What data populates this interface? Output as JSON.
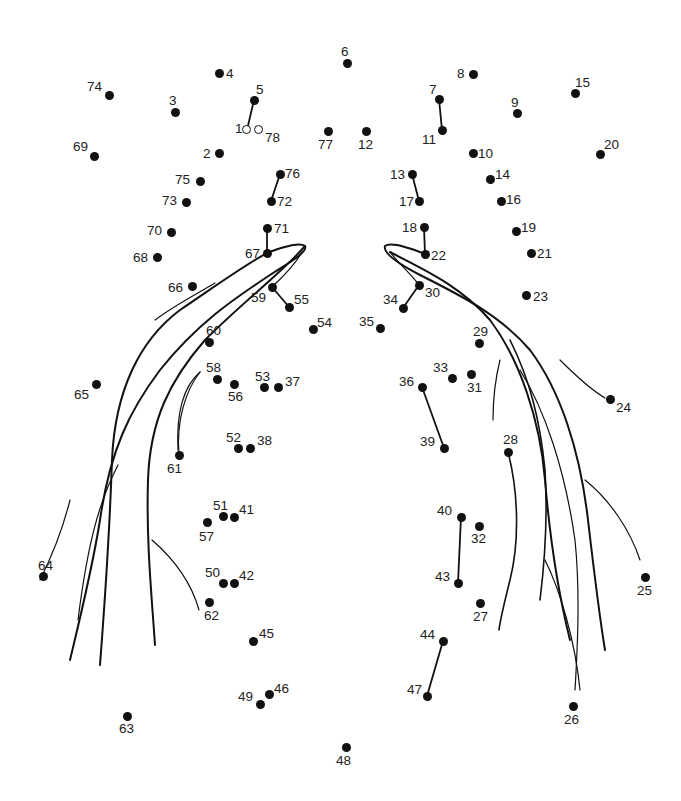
{
  "puzzle": {
    "type": "connect-the-dots",
    "ink_color": "#111111",
    "background": "#ffffff",
    "dots": [
      {
        "n": "1",
        "x": 247,
        "y": 130,
        "hollow": true,
        "lx": 235,
        "ly": 122
      },
      {
        "n": "2",
        "x": 219,
        "y": 153,
        "lx": 203,
        "ly": 147
      },
      {
        "n": "3",
        "x": 175,
        "y": 112,
        "lx": 169,
        "ly": 94
      },
      {
        "n": "4",
        "x": 219,
        "y": 73,
        "lx": 226,
        "ly": 67
      },
      {
        "n": "5",
        "x": 254,
        "y": 100,
        "lx": 256,
        "ly": 83
      },
      {
        "n": "6",
        "x": 347,
        "y": 63,
        "lx": 341,
        "ly": 45
      },
      {
        "n": "7",
        "x": 439,
        "y": 99,
        "lx": 429,
        "ly": 83
      },
      {
        "n": "8",
        "x": 473,
        "y": 74,
        "lx": 457,
        "ly": 67
      },
      {
        "n": "9",
        "x": 517,
        "y": 113,
        "lx": 511,
        "ly": 96
      },
      {
        "n": "10",
        "x": 473,
        "y": 153,
        "lx": 478,
        "ly": 147
      },
      {
        "n": "11",
        "x": 442,
        "y": 130,
        "lx": 422,
        "ly": 133
      },
      {
        "n": "12",
        "x": 366,
        "y": 131,
        "lx": 358,
        "ly": 138
      },
      {
        "n": "13",
        "x": 412,
        "y": 174,
        "lx": 390,
        "ly": 168
      },
      {
        "n": "14",
        "x": 490,
        "y": 179,
        "lx": 495,
        "ly": 168
      },
      {
        "n": "15",
        "x": 575,
        "y": 93,
        "lx": 575,
        "ly": 76
      },
      {
        "n": "16",
        "x": 501,
        "y": 201,
        "lx": 506,
        "ly": 193
      },
      {
        "n": "17",
        "x": 419,
        "y": 201,
        "lx": 399,
        "ly": 195
      },
      {
        "n": "18",
        "x": 424,
        "y": 227,
        "lx": 402,
        "ly": 221
      },
      {
        "n": "19",
        "x": 516,
        "y": 231,
        "lx": 521,
        "ly": 221
      },
      {
        "n": "20",
        "x": 600,
        "y": 154,
        "lx": 604,
        "ly": 138
      },
      {
        "n": "21",
        "x": 531,
        "y": 253,
        "lx": 537,
        "ly": 247
      },
      {
        "n": "22",
        "x": 425,
        "y": 254,
        "lx": 431,
        "ly": 249
      },
      {
        "n": "23",
        "x": 526,
        "y": 295,
        "lx": 533,
        "ly": 290
      },
      {
        "n": "24",
        "x": 610,
        "y": 399,
        "lx": 616,
        "ly": 401
      },
      {
        "n": "25",
        "x": 645,
        "y": 577,
        "lx": 637,
        "ly": 584
      },
      {
        "n": "26",
        "x": 573,
        "y": 706,
        "lx": 564,
        "ly": 713
      },
      {
        "n": "27",
        "x": 480,
        "y": 603,
        "lx": 473,
        "ly": 610
      },
      {
        "n": "28",
        "x": 508,
        "y": 452,
        "lx": 503,
        "ly": 433
      },
      {
        "n": "29",
        "x": 479,
        "y": 343,
        "lx": 473,
        "ly": 325
      },
      {
        "n": "30",
        "x": 419,
        "y": 285,
        "lx": 425,
        "ly": 286
      },
      {
        "n": "31",
        "x": 471,
        "y": 374,
        "lx": 467,
        "ly": 381
      },
      {
        "n": "32",
        "x": 479,
        "y": 526,
        "lx": 471,
        "ly": 532
      },
      {
        "n": "33",
        "x": 452,
        "y": 378,
        "lx": 433,
        "ly": 361
      },
      {
        "n": "34",
        "x": 403,
        "y": 308,
        "lx": 383,
        "ly": 293
      },
      {
        "n": "35",
        "x": 380,
        "y": 328,
        "lx": 359,
        "ly": 315
      },
      {
        "n": "36",
        "x": 422,
        "y": 387,
        "lx": 399,
        "ly": 375
      },
      {
        "n": "37",
        "x": 278,
        "y": 387,
        "lx": 285,
        "ly": 375
      },
      {
        "n": "38",
        "x": 250,
        "y": 448,
        "lx": 257,
        "ly": 434
      },
      {
        "n": "39",
        "x": 444,
        "y": 448,
        "lx": 420,
        "ly": 435
      },
      {
        "n": "40",
        "x": 461,
        "y": 517,
        "lx": 437,
        "ly": 504
      },
      {
        "n": "41",
        "x": 234,
        "y": 517,
        "lx": 239,
        "ly": 503
      },
      {
        "n": "42",
        "x": 234,
        "y": 583,
        "lx": 239,
        "ly": 569
      },
      {
        "n": "43",
        "x": 458,
        "y": 583,
        "lx": 435,
        "ly": 570
      },
      {
        "n": "44",
        "x": 443,
        "y": 641,
        "lx": 420,
        "ly": 628
      },
      {
        "n": "45",
        "x": 253,
        "y": 641,
        "lx": 259,
        "ly": 627
      },
      {
        "n": "46",
        "x": 269,
        "y": 694,
        "lx": 274,
        "ly": 682
      },
      {
        "n": "47",
        "x": 427,
        "y": 696,
        "lx": 407,
        "ly": 683
      },
      {
        "n": "48",
        "x": 346,
        "y": 747,
        "lx": 336,
        "ly": 754
      },
      {
        "n": "49",
        "x": 260,
        "y": 704,
        "lx": 238,
        "ly": 690
      },
      {
        "n": "50",
        "x": 223,
        "y": 583,
        "lx": 205,
        "ly": 566
      },
      {
        "n": "51",
        "x": 223,
        "y": 516,
        "lx": 213,
        "ly": 499
      },
      {
        "n": "52",
        "x": 238,
        "y": 448,
        "lx": 226,
        "ly": 431
      },
      {
        "n": "53",
        "x": 264,
        "y": 387,
        "lx": 255,
        "ly": 370
      },
      {
        "n": "54",
        "x": 313,
        "y": 329,
        "lx": 317,
        "ly": 316
      },
      {
        "n": "55",
        "x": 289,
        "y": 307,
        "lx": 294,
        "ly": 293
      },
      {
        "n": "56",
        "x": 234,
        "y": 384,
        "lx": 228,
        "ly": 390
      },
      {
        "n": "57",
        "x": 207,
        "y": 522,
        "lx": 199,
        "ly": 530
      },
      {
        "n": "58",
        "x": 217,
        "y": 379,
        "lx": 206,
        "ly": 361
      },
      {
        "n": "59",
        "x": 272,
        "y": 287,
        "lx": 251,
        "ly": 291
      },
      {
        "n": "60",
        "x": 209,
        "y": 342,
        "lx": 206,
        "ly": 324
      },
      {
        "n": "61",
        "x": 179,
        "y": 455,
        "lx": 167,
        "ly": 462
      },
      {
        "n": "62",
        "x": 209,
        "y": 602,
        "lx": 204,
        "ly": 609
      },
      {
        "n": "63",
        "x": 127,
        "y": 716,
        "lx": 119,
        "ly": 722
      },
      {
        "n": "64",
        "x": 43,
        "y": 576,
        "lx": 38,
        "ly": 559
      },
      {
        "n": "65",
        "x": 96,
        "y": 384,
        "lx": 74,
        "ly": 388
      },
      {
        "n": "66",
        "x": 192,
        "y": 286,
        "lx": 168,
        "ly": 281
      },
      {
        "n": "67",
        "x": 267,
        "y": 253,
        "lx": 245,
        "ly": 247
      },
      {
        "n": "68",
        "x": 157,
        "y": 257,
        "lx": 133,
        "ly": 251
      },
      {
        "n": "69",
        "x": 94,
        "y": 156,
        "lx": 73,
        "ly": 140
      },
      {
        "n": "70",
        "x": 171,
        "y": 232,
        "lx": 147,
        "ly": 224
      },
      {
        "n": "71",
        "x": 267,
        "y": 228,
        "lx": 274,
        "ly": 222
      },
      {
        "n": "72",
        "x": 271,
        "y": 201,
        "lx": 277,
        "ly": 195
      },
      {
        "n": "73",
        "x": 186,
        "y": 202,
        "lx": 162,
        "ly": 194
      },
      {
        "n": "74",
        "x": 109,
        "y": 95,
        "lx": 87,
        "ly": 80
      },
      {
        "n": "75",
        "x": 200,
        "y": 181,
        "lx": 175,
        "ly": 173
      },
      {
        "n": "76",
        "x": 280,
        "y": 174,
        "lx": 285,
        "ly": 167
      },
      {
        "n": "77",
        "x": 328,
        "y": 131,
        "lx": 318,
        "ly": 138
      },
      {
        "n": "78",
        "x": 259,
        "y": 130,
        "hollow": true,
        "lx": 265,
        "ly": 131
      }
    ],
    "pre_drawn_segments": [
      [
        "5",
        "1"
      ],
      [
        "7",
        "11"
      ],
      [
        "13",
        "17"
      ],
      [
        "76",
        "72"
      ],
      [
        "71",
        "67"
      ],
      [
        "18",
        "22"
      ],
      [
        "59",
        "55"
      ],
      [
        "30",
        "34"
      ],
      [
        "36",
        "39"
      ],
      [
        "40",
        "43"
      ],
      [
        "44",
        "47"
      ]
    ]
  }
}
